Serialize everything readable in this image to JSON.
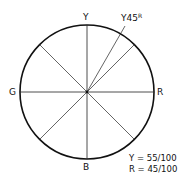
{
  "diagram": {
    "type": "NCS colour circle",
    "labels": {
      "top": "Y",
      "right": "R",
      "bottom": "B",
      "left": "G"
    },
    "hue_label": {
      "base": "Y45",
      "suffix": "R"
    },
    "notes": [
      "Y = 55/100",
      "R = 45/100"
    ],
    "line_color": "#111111"
  }
}
